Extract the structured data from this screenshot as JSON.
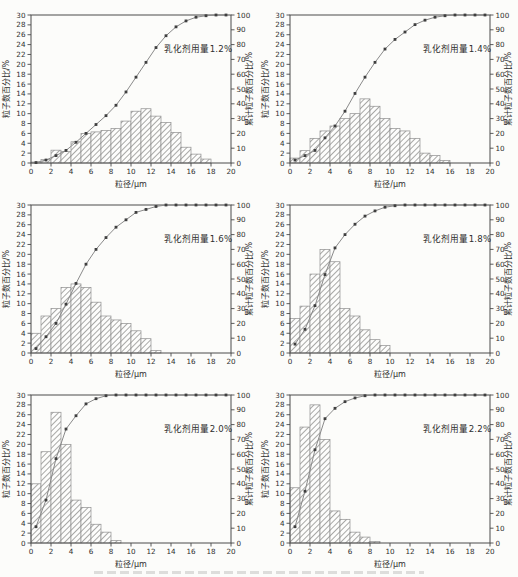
{
  "colors": {
    "background": "#fcfcfa",
    "axis": "#4a4a4a",
    "text": "#2e2e2e",
    "bar_fill": "#fdfdfc",
    "bar_edge": "#8f8f8f",
    "hatch": "#a8a8a6",
    "curve": "#8a8a8a",
    "marker": "#3f3f3f"
  },
  "chart_data": [
    {
      "type": "bar",
      "title": "乳化剂用量1.2%",
      "xlabel": "粒径/μm",
      "ylabel_left": "粒子数百分比/%",
      "ylabel_right": "累计粒子数百分比/%",
      "xlim": [
        0,
        20
      ],
      "xticks_step": 2,
      "ylim_left": [
        0,
        30
      ],
      "yticks_step_left": 2,
      "ylim_right": [
        0,
        100
      ],
      "yticks_step_right": 10,
      "grid": false,
      "legend": "none",
      "bars": {
        "bin_width": 1,
        "centers": [
          0.5,
          1.5,
          2.5,
          3.5,
          4.5,
          5.5,
          6.5,
          7.5,
          8.5,
          9.5,
          10.5,
          11.5,
          12.5,
          13.5,
          14.5,
          15.5,
          16.5,
          17.5
        ],
        "values": [
          0.2,
          0.7,
          2.6,
          2.3,
          4.3,
          6.0,
          6.3,
          6.6,
          7.0,
          8.5,
          10.5,
          11.0,
          9.5,
          8.2,
          6.2,
          3.2,
          1.8,
          0.8
        ]
      },
      "cumulative": {
        "x": [
          0.5,
          1.5,
          2.5,
          3.5,
          4.5,
          5.5,
          6.5,
          7.5,
          8.5,
          9.5,
          10.5,
          11.5,
          12.5,
          13.5,
          14.5,
          15.5,
          16.5,
          17.5,
          18.5,
          19.5
        ],
        "y": [
          0.3,
          2,
          5,
          8.5,
          14,
          20,
          26,
          32,
          39,
          48,
          58,
          68,
          78,
          86,
          92,
          96,
          98.5,
          99.5,
          100,
          100
        ]
      }
    },
    {
      "type": "bar",
      "title": "乳化剂用量1.4%",
      "xlabel": "粒径/μm",
      "ylabel_left": "粒子数百分比/%",
      "ylabel_right": "累计粒子数百分比/%",
      "xlim": [
        0,
        20
      ],
      "xticks_step": 2,
      "ylim_left": [
        0,
        30
      ],
      "yticks_step_left": 2,
      "ylim_right": [
        0,
        100
      ],
      "yticks_step_right": 10,
      "grid": false,
      "legend": "none",
      "bars": {
        "bin_width": 1,
        "centers": [
          0.5,
          1.5,
          2.5,
          3.5,
          4.5,
          5.5,
          6.5,
          7.5,
          8.5,
          9.5,
          10.5,
          11.5,
          12.5,
          13.5,
          14.5,
          15.5
        ],
        "values": [
          1.0,
          2.5,
          5.0,
          6.5,
          7.5,
          9.0,
          10.0,
          13.0,
          11.5,
          9.0,
          7.0,
          6.5,
          5.0,
          2.0,
          1.5,
          0.5
        ]
      },
      "cumulative": {
        "x": [
          0.5,
          1.5,
          2.5,
          3.5,
          4.5,
          5.5,
          6.5,
          7.5,
          8.5,
          9.5,
          10.5,
          11.5,
          12.5,
          13.5,
          14.5,
          15.5,
          16.5,
          17.5,
          18.5,
          19.5
        ],
        "y": [
          2,
          5,
          8.5,
          17,
          25,
          35,
          47,
          58,
          68,
          77,
          83.5,
          88.5,
          93.5,
          96.5,
          98.5,
          99.5,
          100,
          100,
          100,
          100
        ]
      }
    },
    {
      "type": "bar",
      "title": "乳化剂用量1.6%",
      "xlabel": "粒径/μm",
      "ylabel_left": "粒子数百分比/%",
      "ylabel_right": "累计粒子数百分比/%",
      "xlim": [
        0,
        20
      ],
      "xticks_step": 2,
      "ylim_left": [
        0,
        30
      ],
      "yticks_step_left": 2,
      "ylim_right": [
        0,
        100
      ],
      "yticks_step_right": 10,
      "grid": false,
      "legend": "none",
      "bars": {
        "bin_width": 1,
        "centers": [
          0.5,
          1.5,
          2.5,
          3.5,
          4.5,
          5.5,
          6.5,
          7.5,
          8.5,
          9.5,
          10.5,
          11.5,
          12.5
        ],
        "values": [
          4.0,
          7.5,
          9.0,
          13.3,
          14.0,
          13.3,
          10.3,
          7.5,
          6.7,
          6.0,
          4.5,
          2.9,
          0.5
        ]
      },
      "cumulative": {
        "x": [
          0.5,
          1.5,
          2.5,
          3.5,
          4.5,
          5.5,
          6.5,
          7.5,
          8.5,
          9.5,
          10.5,
          11.5,
          12.5,
          13.5,
          14.5,
          15.5,
          16.5,
          17.5,
          18.5,
          19.5
        ],
        "y": [
          3,
          11,
          20,
          33,
          47,
          60,
          70,
          78,
          85,
          90,
          95,
          97,
          99,
          100,
          100,
          100,
          100,
          100,
          100,
          100
        ]
      }
    },
    {
      "type": "bar",
      "title": "乳化剂用量1.8%",
      "xlabel": "粒径/μm",
      "ylabel_left": "粒子数百分比/%",
      "ylabel_right": "累计粒子数百分比/%",
      "xlim": [
        0,
        20
      ],
      "xticks_step": 2,
      "ylim_left": [
        0,
        30
      ],
      "yticks_step_left": 2,
      "ylim_right": [
        0,
        100
      ],
      "yticks_step_right": 10,
      "grid": false,
      "legend": "none",
      "bars": {
        "bin_width": 1,
        "centers": [
          0.5,
          1.5,
          2.5,
          3.5,
          4.5,
          5.5,
          6.5,
          7.5,
          8.5,
          9.5
        ],
        "values": [
          7.0,
          9.5,
          16.0,
          21.0,
          18.5,
          9.0,
          7.5,
          4.7,
          2.7,
          1.5
        ]
      },
      "cumulative": {
        "x": [
          0.5,
          1.5,
          2.5,
          3.5,
          4.5,
          5.5,
          6.5,
          7.5,
          8.5,
          9.5,
          10.5,
          11.5,
          12.5,
          13.5,
          14.5,
          15.5,
          16.5,
          17.5,
          18.5,
          19.5
        ],
        "y": [
          6,
          16,
          32,
          53,
          71,
          80,
          87,
          92.5,
          96,
          98.5,
          99.5,
          100,
          100,
          100,
          100,
          100,
          100,
          100,
          100,
          100
        ]
      }
    },
    {
      "type": "bar",
      "title": "乳化剂用量2.0%",
      "xlabel": "粒径/μm",
      "ylabel_left": "粒子数百分比/%",
      "ylabel_right": "累计粒子数百分比/%",
      "xlim": [
        0,
        20
      ],
      "xticks_step": 2,
      "ylim_left": [
        0,
        30
      ],
      "yticks_step_left": 2,
      "ylim_right": [
        0,
        100
      ],
      "yticks_step_right": 10,
      "grid": false,
      "legend": "none",
      "bars": {
        "bin_width": 1,
        "centers": [
          0.5,
          1.5,
          2.5,
          3.5,
          4.5,
          5.5,
          6.5,
          7.5,
          8.5
        ],
        "values": [
          12.0,
          18.5,
          26.5,
          20.0,
          8.7,
          7.2,
          3.8,
          2.2,
          0.5
        ]
      },
      "cumulative": {
        "x": [
          0.5,
          1.5,
          2.5,
          3.5,
          4.5,
          5.5,
          6.5,
          7.5,
          8.5,
          9.5,
          10.5,
          11.5,
          12.5,
          13.5,
          14.5,
          15.5,
          16.5,
          17.5,
          18.5,
          19.5
        ],
        "y": [
          11,
          29,
          57,
          77,
          86,
          94,
          97.5,
          99.5,
          100,
          100,
          100,
          100,
          100,
          100,
          100,
          100,
          100,
          100,
          100,
          100
        ]
      }
    },
    {
      "type": "bar",
      "title": "乳化剂用量2.2%",
      "xlabel": "粒径/μm",
      "ylabel_left": "粒子数百分比/%",
      "ylabel_right": "累计粒子数百分比/%",
      "xlim": [
        0,
        20
      ],
      "xticks_step": 2,
      "ylim_left": [
        0,
        30
      ],
      "yticks_step_left": 2,
      "ylim_right": [
        0,
        100
      ],
      "yticks_step_right": 10,
      "grid": false,
      "legend": "none",
      "bars": {
        "bin_width": 1,
        "centers": [
          0.5,
          1.5,
          2.5,
          3.5,
          4.5,
          5.5,
          6.5,
          7.5,
          8.5
        ],
        "values": [
          11.2,
          23.5,
          28.0,
          21.0,
          6.5,
          4.8,
          2.2,
          1.2,
          0.3
        ]
      },
      "cumulative": {
        "x": [
          0.5,
          1.5,
          2.5,
          3.5,
          4.5,
          5.5,
          6.5,
          7.5,
          8.5,
          9.5,
          10.5,
          11.5,
          12.5,
          13.5,
          14.5,
          15.5,
          16.5,
          17.5,
          18.5,
          19.5
        ],
        "y": [
          11,
          35,
          63,
          84,
          91,
          95.5,
          98,
          99.5,
          100,
          100,
          100,
          100,
          100,
          100,
          100,
          100,
          100,
          100,
          100,
          100
        ]
      }
    }
  ]
}
